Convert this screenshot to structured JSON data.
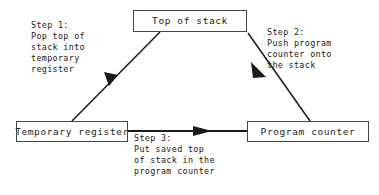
{
  "diagram": {
    "canvas": {
      "width": 379,
      "height": 195
    },
    "colors": {
      "background": "#ffffff",
      "stroke": "#1a1a1a",
      "box_border": "#444444",
      "text": "#1a1a1a"
    },
    "nodes": [
      {
        "id": "top_of_stack",
        "label": "Top of stack"
      },
      {
        "id": "temporary_register",
        "label": "Temporary register"
      },
      {
        "id": "program_counter",
        "label": "Program counter"
      }
    ],
    "steps": [
      {
        "id": "step_1",
        "heading": "Step 1:",
        "body": "Pop top of\nstack into\ntemporary\nregister",
        "text": "Step 1:\nPop top of\nstack into\ntemporary\nregister",
        "from": "top_of_stack",
        "to": "temporary_register"
      },
      {
        "id": "step_2",
        "heading": "Step 2:",
        "body": "Push program\ncounter onto\nthe stack",
        "text": "Step 2:\nPush program\ncounter onto\nthe stack",
        "from": "program_counter",
        "to": "top_of_stack"
      },
      {
        "id": "step_3",
        "heading": "Step 3:",
        "body": "Put saved top\nof stack in the\nprogram counter",
        "text": "Step 3:\nPut saved top\nof stack in the\nprogram counter",
        "from": "temporary_register",
        "to": "program_counter"
      }
    ]
  }
}
